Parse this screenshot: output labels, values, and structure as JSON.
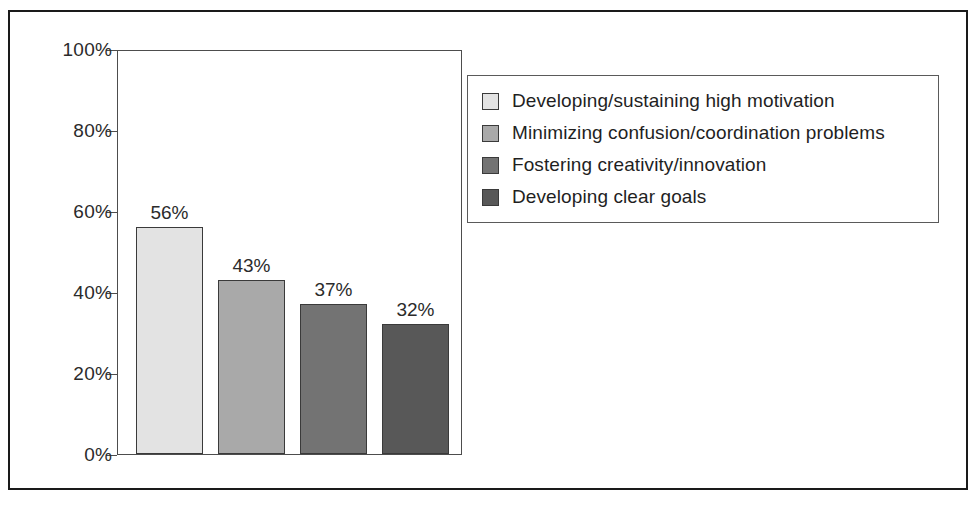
{
  "chart_data": {
    "type": "bar",
    "title": "",
    "subtitle": "",
    "xlabel": "",
    "ylabel": "",
    "ylim": [
      0,
      100
    ],
    "grid": false,
    "legend_position": "right",
    "value_label_suffix": "%",
    "categories": [
      "Developing/sustaining high motivation",
      "Minimizing confusion/coordination problems",
      "Fostering creativity/innovation",
      "Developing clear goals"
    ],
    "values": [
      56,
      43,
      37,
      32
    ],
    "value_labels": [
      "56%",
      "43%",
      "37%",
      "32%"
    ],
    "colors": [
      "#e3e3e3",
      "#a9a9a9",
      "#737373",
      "#585858"
    ],
    "yticks": [
      0,
      20,
      40,
      60,
      80,
      100
    ],
    "ytick_labels": [
      "0%",
      "20%",
      "40%",
      "60%",
      "80%",
      "100%"
    ]
  },
  "legend": {
    "items": [
      {
        "label": "Developing/sustaining high motivation",
        "color": "#e3e3e3"
      },
      {
        "label": "Minimizing confusion/coordination problems",
        "color": "#a9a9a9"
      },
      {
        "label": "Fostering creativity/innovation",
        "color": "#737373"
      },
      {
        "label": "Developing clear goals",
        "color": "#585858"
      }
    ]
  },
  "style": {
    "frame_color": "#1a1a1a",
    "axis_color": "#4d4d4d",
    "text_color": "#2b2b2b",
    "background": "#ffffff"
  }
}
